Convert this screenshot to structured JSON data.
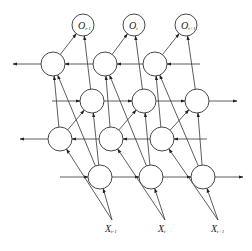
{
  "diagram": {
    "type": "deep bidirectional recurrent neural network",
    "outputs": [
      {
        "base": "O",
        "sub": "t-1",
        "x": 83,
        "y": 25
      },
      {
        "base": "O",
        "sub": "t",
        "x": 134,
        "y": 25
      },
      {
        "base": "O",
        "sub": "t+1",
        "x": 186,
        "y": 25
      }
    ],
    "inputs": [
      {
        "base": "X",
        "sub": "t-1",
        "x": 110,
        "y": 228
      },
      {
        "base": "X",
        "sub": "t",
        "x": 163,
        "y": 228
      },
      {
        "base": "X",
        "sub": "t+1",
        "x": 216,
        "y": 228
      }
    ],
    "layers": [
      {
        "name": "backward-layer-2",
        "direction": "left",
        "y": 64,
        "xs": [
          53,
          105,
          155
        ]
      },
      {
        "name": "forward-layer-2",
        "direction": "right",
        "y": 101,
        "xs": [
          92,
          144,
          197
        ]
      },
      {
        "name": "backward-layer-1",
        "direction": "left",
        "y": 139,
        "xs": [
          60,
          111,
          162
        ]
      },
      {
        "name": "forward-layer-1",
        "direction": "right",
        "y": 177,
        "xs": [
          100,
          151,
          203
        ]
      }
    ]
  }
}
